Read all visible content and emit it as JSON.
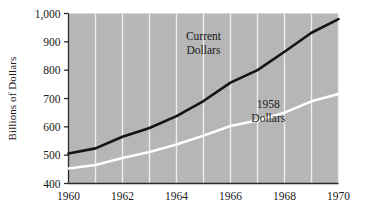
{
  "chart_data": {
    "type": "line",
    "title": "",
    "xlabel": "",
    "ylabel": "Billions of Dollars",
    "xlim": [
      1960,
      1970
    ],
    "ylim": [
      400,
      1000
    ],
    "grid": true,
    "legend_position": "inline-annotation",
    "x": [
      1960,
      1961,
      1962,
      1963,
      1964,
      1965,
      1966,
      1967,
      1968,
      1969,
      1970
    ],
    "xtick_labels": [
      "1960",
      "1962",
      "1964",
      "1966",
      "1968",
      "1970"
    ],
    "xtick_values": [
      1960,
      1962,
      1964,
      1966,
      1968,
      1970
    ],
    "ytick_labels": [
      "400",
      "500",
      "600",
      "700",
      "800",
      "900",
      "1,000"
    ],
    "ytick_values": [
      400,
      500,
      600,
      700,
      800,
      900,
      1000
    ],
    "series": [
      {
        "name": "Current Dollars",
        "color": "#141414",
        "values": [
          506,
          524,
          565,
          596,
          638,
          691,
          756,
          800,
          865,
          932,
          980
        ]
      },
      {
        "name": "1958 Dollars",
        "color": "#ffffff",
        "values": [
          453,
          465,
          490,
          511,
          538,
          569,
          603,
          622,
          650,
          690,
          716
        ]
      }
    ],
    "annotations": [
      {
        "text_line1": "Current",
        "text_line2": "Dollars",
        "x": 1965.0,
        "y": 905
      },
      {
        "text_line1": "1958",
        "text_line2": "Dollars",
        "x": 1967.4,
        "y": 665
      }
    ],
    "plot_background": "#b6b6b6",
    "gridline_color": "#f2f2f2",
    "axis_color": "#2b2b2b"
  },
  "axis": {
    "y_title": "Billions of Dollars",
    "y_ticks": [
      "1,000",
      "900",
      "800",
      "700",
      "600",
      "500",
      "400"
    ],
    "x_ticks": [
      "1960",
      "1962",
      "1964",
      "1966",
      "1968",
      "1970"
    ]
  },
  "labels": {
    "current_dollars_line1": "Current",
    "current_dollars_line2": "Dollars",
    "constant_dollars_line1": "1958",
    "constant_dollars_line2": "Dollars"
  }
}
